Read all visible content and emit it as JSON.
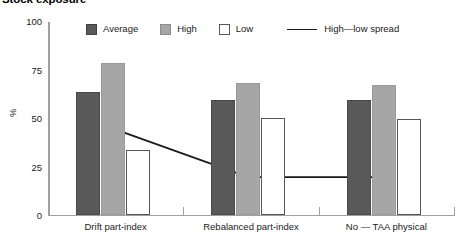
{
  "title": "Stock exposure",
  "legend": {
    "items": [
      {
        "label": "Average",
        "swatch": "avg"
      },
      {
        "label": "High",
        "swatch": "high"
      },
      {
        "label": "Low",
        "swatch": "low"
      },
      {
        "label": "High—low spread",
        "swatch": "line"
      }
    ]
  },
  "axes": {
    "ylabel": "%",
    "yticks": [
      "0",
      "25",
      "50",
      "75",
      "100"
    ]
  },
  "chart_data": {
    "type": "bar",
    "title": "Stock exposure",
    "xlabel": "",
    "ylabel": "%",
    "ylim": [
      0,
      100
    ],
    "yticks": [
      0,
      25,
      50,
      75,
      100
    ],
    "grid": false,
    "legend_position": "top",
    "categories": [
      "Drift part-index",
      "Rebalanced part-index",
      "No — TAA physical"
    ],
    "series": [
      {
        "name": "Average",
        "type": "bar",
        "color": "#595959",
        "values": [
          63,
          59,
          59
        ]
      },
      {
        "name": "High",
        "type": "bar",
        "color": "#a6a6a6",
        "values": [
          78,
          68,
          67
        ]
      },
      {
        "name": "Low",
        "type": "bar",
        "color": "#ffffff",
        "values": [
          33,
          50,
          49
        ]
      },
      {
        "name": "High—low spread",
        "type": "line",
        "color": "#1a1a1a",
        "values": [
          45,
          20,
          20
        ]
      }
    ]
  }
}
